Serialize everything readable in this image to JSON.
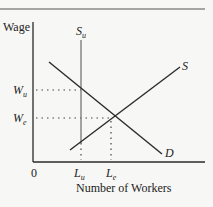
{
  "diagram": {
    "type": "labor-market-union-supply",
    "y_axis_label": "Wage",
    "x_axis_label": "Number of Workers",
    "origin_label": "0",
    "curves": {
      "union_supply": {
        "label_main": "S",
        "label_sub": "u"
      },
      "supply": {
        "label": "S"
      },
      "demand": {
        "label": "D"
      }
    },
    "wage_ticks": [
      {
        "label_main": "W",
        "label_sub": "u"
      },
      {
        "label_main": "W",
        "label_sub": "e"
      }
    ],
    "quantity_ticks": [
      {
        "label_main": "L",
        "label_sub": "u"
      },
      {
        "label_main": "L",
        "label_sub": "e"
      }
    ],
    "colors": {
      "line": "#2a2a2a",
      "union_supply_line": "#777777",
      "border": "#8a8a8a",
      "background": "#f7f7f5"
    }
  }
}
